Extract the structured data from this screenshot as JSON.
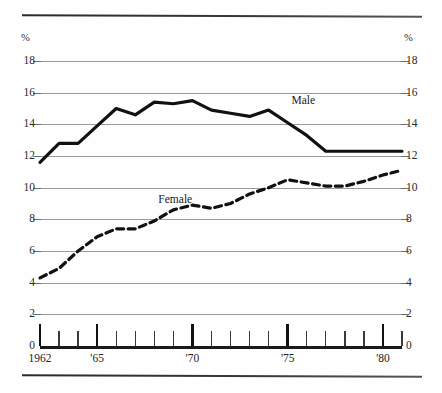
{
  "figure": {
    "unit_label_left": "%",
    "unit_label_right": "%",
    "series_label_male": "Male",
    "series_label_female": "Female"
  },
  "chart_data": {
    "type": "line",
    "title": "",
    "subtitle": "",
    "xlabel": "",
    "ylabel": "%",
    "ylim": [
      0,
      18
    ],
    "xlim": [
      1962,
      1981
    ],
    "grid": true,
    "grid_axis": "y",
    "legend": "inline-annotations",
    "y_unit": "%",
    "y_ticks": [
      0,
      2,
      4,
      6,
      8,
      10,
      12,
      14,
      16,
      18
    ],
    "y_tick_labels": [
      "0",
      "2",
      "4",
      "6",
      "8",
      "10",
      "12",
      "14",
      "16",
      "18"
    ],
    "y_axis_duplicated_right": true,
    "x_ticks": [
      1962,
      1963,
      1964,
      1965,
      1966,
      1967,
      1968,
      1969,
      1970,
      1971,
      1972,
      1973,
      1974,
      1975,
      1976,
      1977,
      1978,
      1979,
      1980,
      1981
    ],
    "x_major_ticks": [
      1962,
      1965,
      1970,
      1975,
      1980
    ],
    "x_tick_labels": [
      "1962",
      "'65",
      "'70",
      "'75",
      "'80"
    ],
    "x": [
      1962,
      1963,
      1964,
      1965,
      1966,
      1967,
      1968,
      1969,
      1970,
      1971,
      1972,
      1973,
      1974,
      1975,
      1976,
      1977,
      1978,
      1979,
      1980,
      1981
    ],
    "series": [
      {
        "name": "Male",
        "style": "solid",
        "color": "#111111",
        "linewidth": 3.2,
        "label_position": {
          "x": 1975.2,
          "y": 15.5
        },
        "values": [
          11.6,
          12.8,
          12.8,
          13.9,
          15.0,
          14.6,
          15.4,
          15.3,
          15.5,
          14.9,
          14.7,
          14.5,
          14.9,
          14.1,
          13.3,
          12.3,
          12.3,
          12.3,
          12.3,
          12.3
        ]
      },
      {
        "name": "Female",
        "style": "dashed",
        "color": "#111111",
        "linewidth": 3.2,
        "label_position": {
          "x": 1969.1,
          "y": 9.2
        },
        "values": [
          4.3,
          4.9,
          6.0,
          6.9,
          7.4,
          7.4,
          7.9,
          8.6,
          8.9,
          8.7,
          9.0,
          9.6,
          10.0,
          10.5,
          10.3,
          10.1,
          10.1,
          10.4,
          10.8,
          11.1
        ]
      }
    ]
  }
}
